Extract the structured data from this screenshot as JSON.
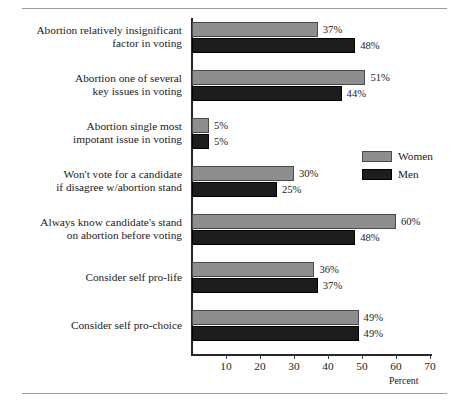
{
  "chart_data": {
    "type": "bar",
    "orientation": "horizontal",
    "title": "",
    "subtitle": "",
    "xlabel": "Percent",
    "ylabel": "",
    "xlim": [
      0,
      70
    ],
    "xticks": [
      10,
      20,
      30,
      40,
      50,
      60,
      70
    ],
    "xtick_labels": [
      "10",
      "20",
      "30",
      "40",
      "50",
      "60",
      "70"
    ],
    "grid": false,
    "legend_position": "center-right",
    "value_label_suffix": "%",
    "categories": [
      "Abortion relatively insignificant\nfactor in voting",
      "Abortion one of several\nkey issues in voting",
      "Abortion single most\nimpotant issue in voting",
      "Won't vote for a candidate\nif disagree w/abortion stand",
      "Always know candidate's stand\non abortion before voting",
      "Consider self pro-life",
      "Consider self pro-choice"
    ],
    "series": [
      {
        "name": "Women",
        "color": "#8e8e8e",
        "values": [
          37,
          51,
          5,
          30,
          60,
          36,
          49
        ],
        "value_labels": [
          "37%",
          "51%",
          "5%",
          "30%",
          "60%",
          "36%",
          "49%"
        ]
      },
      {
        "name": "Men",
        "color": "#1d1d1d",
        "values": [
          48,
          44,
          5,
          25,
          48,
          37,
          49
        ],
        "value_labels": [
          "48%",
          "44%",
          "5%",
          "25%",
          "48%",
          "37%",
          "49%"
        ]
      }
    ],
    "rows": [
      {
        "label": "Abortion relatively insignificant\nfactor in voting",
        "lines": 2,
        "women": {
          "value": 37,
          "label": "37%"
        },
        "men": {
          "value": 48,
          "label": "48%"
        }
      },
      {
        "label": "Abortion one of several\nkey issues in voting",
        "lines": 2,
        "women": {
          "value": 51,
          "label": "51%"
        },
        "men": {
          "value": 44,
          "label": "44%"
        }
      },
      {
        "label": "Abortion single most\nimpotant issue in voting",
        "lines": 2,
        "women": {
          "value": 5,
          "label": "5%"
        },
        "men": {
          "value": 5,
          "label": "5%"
        }
      },
      {
        "label": "Won't vote for a candidate\nif disagree w/abortion stand",
        "lines": 2,
        "women": {
          "value": 30,
          "label": "30%"
        },
        "men": {
          "value": 25,
          "label": "25%"
        }
      },
      {
        "label": "Always know candidate's stand\non abortion before voting",
        "lines": 2,
        "women": {
          "value": 60,
          "label": "60%"
        },
        "men": {
          "value": 48,
          "label": "48%"
        }
      },
      {
        "label": "Consider self pro-life",
        "lines": 1,
        "women": {
          "value": 36,
          "label": "36%"
        },
        "men": {
          "value": 37,
          "label": "37%"
        }
      },
      {
        "label": "Consider self pro-choice",
        "lines": 1,
        "women": {
          "value": 49,
          "label": "49%"
        },
        "men": {
          "value": 49,
          "label": "49%"
        }
      }
    ],
    "legend": [
      {
        "label": "Women",
        "color": "#8e8e8e"
      },
      {
        "label": "Men",
        "color": "#1d1d1d"
      }
    ]
  }
}
